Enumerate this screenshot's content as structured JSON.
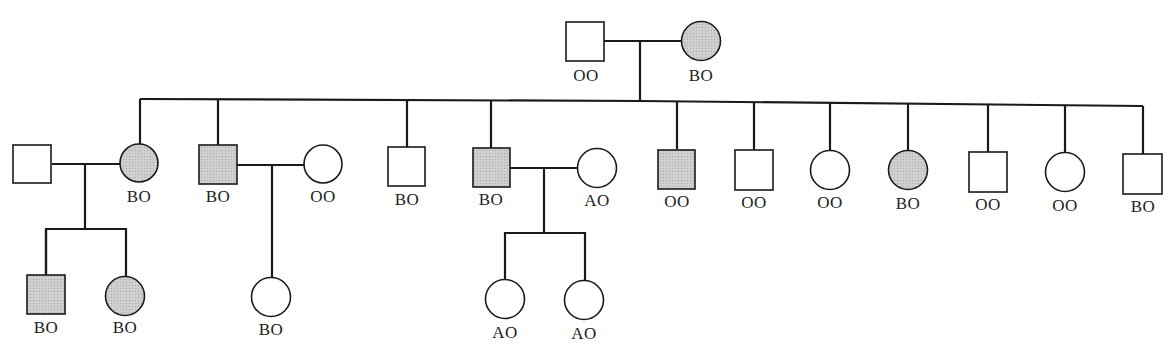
{
  "diagram": {
    "type": "pedigree",
    "legend_colors": {
      "affected_fill": "#c8c8c8",
      "unaffected_fill": "#ffffff",
      "stroke": "#1a1a1a"
    },
    "generations": [
      {
        "name": "I",
        "individuals": [
          {
            "id": "I-1",
            "sex": "male",
            "affected": false,
            "genotype": "OO"
          },
          {
            "id": "I-2",
            "sex": "female",
            "affected": true,
            "genotype": "BO"
          }
        ]
      },
      {
        "name": "II",
        "individuals": [
          {
            "id": "II-spouse-1",
            "sex": "male",
            "affected": false,
            "genotype": ""
          },
          {
            "id": "II-1",
            "sex": "female",
            "affected": true,
            "genotype": "BO"
          },
          {
            "id": "II-2",
            "sex": "male",
            "affected": true,
            "genotype": "BO"
          },
          {
            "id": "II-spouse-2",
            "sex": "female",
            "affected": false,
            "genotype": "OO"
          },
          {
            "id": "II-3",
            "sex": "male",
            "affected": false,
            "genotype": "BO"
          },
          {
            "id": "II-4",
            "sex": "male",
            "affected": true,
            "genotype": "BO"
          },
          {
            "id": "II-spouse-3",
            "sex": "female",
            "affected": false,
            "genotype": "AO"
          },
          {
            "id": "II-5",
            "sex": "male",
            "affected": true,
            "genotype": "OO"
          },
          {
            "id": "II-6",
            "sex": "male",
            "affected": false,
            "genotype": "OO"
          },
          {
            "id": "II-7",
            "sex": "female",
            "affected": false,
            "genotype": "OO"
          },
          {
            "id": "II-8",
            "sex": "female",
            "affected": true,
            "genotype": "BO"
          },
          {
            "id": "II-9",
            "sex": "male",
            "affected": false,
            "genotype": "OO"
          },
          {
            "id": "II-10",
            "sex": "female",
            "affected": false,
            "genotype": "OO"
          },
          {
            "id": "II-11",
            "sex": "male",
            "affected": false,
            "genotype": "BO"
          }
        ]
      },
      {
        "name": "III",
        "individuals": [
          {
            "id": "III-1",
            "sex": "male",
            "affected": true,
            "genotype": "BO"
          },
          {
            "id": "III-2",
            "sex": "female",
            "affected": true,
            "genotype": "BO"
          },
          {
            "id": "III-3",
            "sex": "female",
            "affected": false,
            "genotype": "BO"
          },
          {
            "id": "III-4",
            "sex": "female",
            "affected": false,
            "genotype": "AO"
          },
          {
            "id": "III-5",
            "sex": "female",
            "affected": false,
            "genotype": "AO"
          }
        ]
      }
    ]
  },
  "labels": {
    "I1": "OO",
    "I2": "BO",
    "II1": "BO",
    "II2": "BO",
    "IIs2": "OO",
    "II3": "BO",
    "II4": "BO",
    "IIs3": "AO",
    "II5": "OO",
    "II6": "OO",
    "II7": "OO",
    "II8": "BO",
    "II9": "OO",
    "II10": "OO",
    "II11": "BO",
    "III1": "BO",
    "III2": "BO",
    "III3": "BO",
    "III4": "AO",
    "III5": "AO"
  }
}
